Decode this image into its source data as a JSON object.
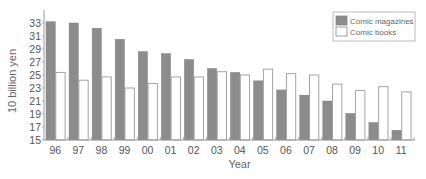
{
  "chart_data": {
    "type": "bar",
    "title": "",
    "xlabel": "Year",
    "ylabel": "10 billion yen",
    "ylim": [
      15,
      34.5
    ],
    "yticks": [
      15,
      17,
      19,
      21,
      23,
      25,
      27,
      29,
      31,
      33
    ],
    "categories": [
      "96",
      "97",
      "98",
      "99",
      "00",
      "01",
      "02",
      "03",
      "04",
      "05",
      "06",
      "07",
      "08",
      "09",
      "10",
      "11"
    ],
    "series": [
      {
        "name": "Comic magazines",
        "color": "#8c8c8c",
        "values": [
          33.2,
          33.0,
          32.2,
          30.5,
          28.6,
          28.3,
          27.4,
          26.0,
          25.4,
          24.1,
          22.7,
          21.9,
          21.0,
          19.1,
          17.7,
          16.5
        ]
      },
      {
        "name": "Comic books",
        "color": "#ffffff",
        "values": [
          25.4,
          24.2,
          24.7,
          23.0,
          23.7,
          24.7,
          24.7,
          25.5,
          25.0,
          25.9,
          25.2,
          25.0,
          23.6,
          22.6,
          23.2,
          22.4
        ]
      }
    ],
    "legend": {
      "position": "top-right",
      "entries": [
        "Comic magazines",
        "Comic books"
      ]
    },
    "grid": false
  }
}
